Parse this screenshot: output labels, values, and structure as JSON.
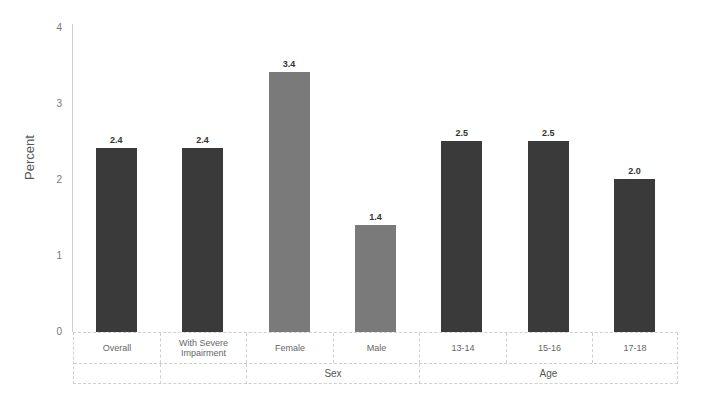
{
  "chart_data": {
    "type": "bar",
    "title": "",
    "xlabel": "",
    "ylabel": "Percent",
    "ylim": [
      0,
      4
    ],
    "yticks": [
      0,
      1,
      2,
      3,
      4
    ],
    "grid": false,
    "categories": [
      "Overall",
      "With Severe Impairment",
      "Female",
      "Male",
      "13-14",
      "15-16",
      "17-18"
    ],
    "values": [
      2.4,
      2.4,
      3.4,
      1.4,
      2.5,
      2.5,
      2.0
    ],
    "value_labels": [
      "2.4",
      "2.4",
      "3.4",
      "1.4",
      "2.5",
      "2.5",
      "2.0"
    ],
    "groups": [
      {
        "label": "",
        "categories": [
          "Overall"
        ]
      },
      {
        "label": "",
        "categories": [
          "With Severe Impairment"
        ]
      },
      {
        "label": "Sex",
        "categories": [
          "Female",
          "Male"
        ]
      },
      {
        "label": "Age",
        "categories": [
          "13-14",
          "15-16",
          "17-18"
        ]
      }
    ],
    "bar_colors": [
      "#3a3a3a",
      "#3a3a3a",
      "#7a7a7a",
      "#7a7a7a",
      "#3a3a3a",
      "#3a3a3a",
      "#3a3a3a"
    ]
  },
  "labels": {
    "ylabel": "Percent",
    "cat": [
      "Overall",
      "With Severe",
      "Impairment",
      "Female",
      "Male",
      "13-14",
      "15-16",
      "17-18"
    ],
    "group_sex": "Sex",
    "group_age": "Age",
    "ticks": [
      "0",
      "1",
      "2",
      "3",
      "4"
    ]
  }
}
